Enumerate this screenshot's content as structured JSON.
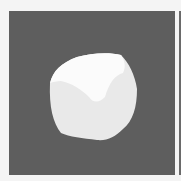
{
  "image": {
    "subject": "rounded white cube-like object",
    "colors": {
      "background": "#5e5e5e",
      "page": "#f4f4f4",
      "object_top": "#fbfbfb",
      "object_side": "#e9e9e9",
      "right_edge": "#6a6a6a"
    }
  }
}
